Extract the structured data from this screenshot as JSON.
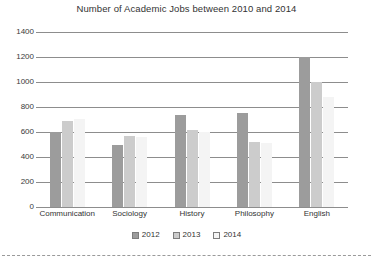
{
  "chart_data": {
    "type": "bar",
    "title": "Number of Academic Jobs between 2010 and 2014",
    "xlabel": "",
    "ylabel": "",
    "ylim": [
      0,
      1400
    ],
    "ytick_step": 200,
    "yticks": [
      1400,
      1200,
      1000,
      800,
      600,
      400,
      200,
      0
    ],
    "ytick_labels": [
      "1400",
      "1200",
      "1000",
      "800",
      "600",
      "400",
      "200",
      "0"
    ],
    "grid": true,
    "legend_position": "bottom-center",
    "categories": [
      "Communication",
      "Sociology",
      "History",
      "Philosophy",
      "English"
    ],
    "series": [
      {
        "name": "2012",
        "color": "#9c9c9c",
        "values": [
          600,
          500,
          740,
          750,
          1200
        ]
      },
      {
        "name": "2013",
        "color": "#cccccc",
        "values": [
          690,
          570,
          620,
          520,
          1000
        ]
      },
      {
        "name": "2014",
        "color": "#f4f4f4",
        "values": [
          705,
          560,
          600,
          510,
          880
        ]
      }
    ]
  },
  "legend": {
    "items": [
      {
        "label": "2012",
        "color": "#9c9c9c"
      },
      {
        "label": "2013",
        "color": "#cccccc"
      },
      {
        "label": "2014",
        "color": "#f4f4f4"
      }
    ]
  }
}
